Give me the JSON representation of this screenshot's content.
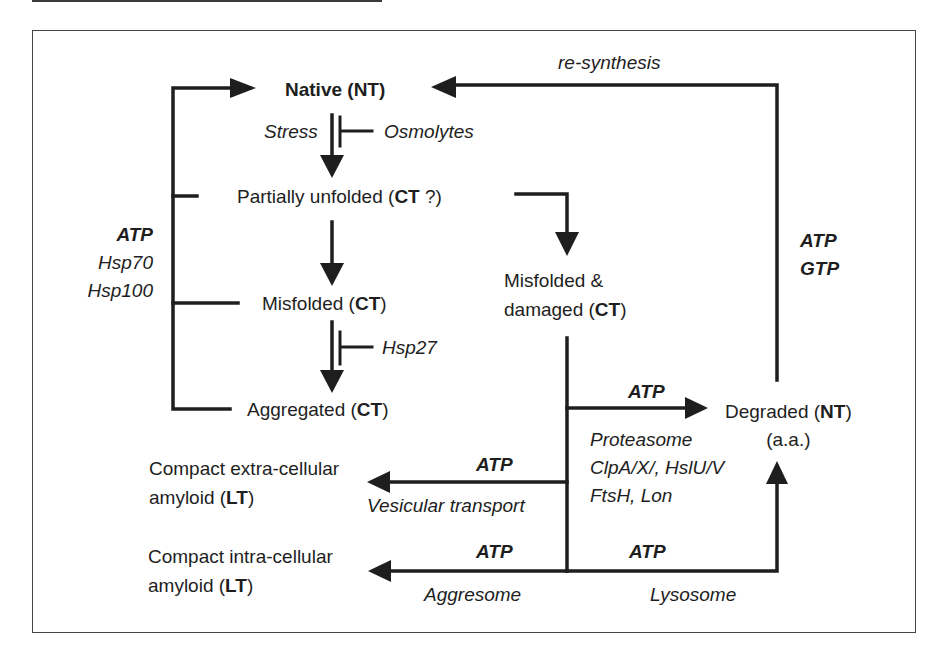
{
  "diagram": {
    "states": {
      "native": {
        "label": "Native",
        "tag": "NT"
      },
      "partially_unfolded": {
        "label": "Partially unfolded",
        "tag": "CT",
        "suffix": " ?"
      },
      "misfolded": {
        "label": "Misfolded",
        "tag": "CT"
      },
      "aggregated": {
        "label": "Aggregated",
        "tag": "CT"
      },
      "misfolded_damaged": {
        "line1": "Misfolded &",
        "line2_label": "damaged",
        "tag": "CT"
      },
      "degraded": {
        "label": "Degraded",
        "tag": "NT",
        "sub": "(a.a.)"
      },
      "extracellular_amyloid": {
        "line1": "Compact extra-cellular",
        "line2_label": "amyloid",
        "tag": "LT"
      },
      "intracellular_amyloid": {
        "line1": "Compact intra-cellular",
        "line2_label": "amyloid",
        "tag": "LT"
      }
    },
    "modifiers": {
      "stress": "Stress",
      "osmolytes": "Osmolytes",
      "hsp27": "Hsp27",
      "refolding": {
        "energy": "ATP",
        "chaperone1": "Hsp70",
        "chaperone2": "Hsp100"
      },
      "resynthesis": "re-synthesis",
      "resynthesis_energy": {
        "line1": "ATP",
        "line2": "GTP"
      },
      "proteasome_energy": "ATP",
      "proteasome": {
        "line1": "Proteasome",
        "line2": "ClpA/X/, HslU/V",
        "line3": "FtsH, Lon"
      },
      "vesicular_energy": "ATP",
      "vesicular": "Vesicular transport",
      "aggresome_energy": "ATP",
      "aggresome": "Aggresome",
      "lysosome_energy": "ATP",
      "lysosome": "Lysosome"
    },
    "paren_open": "(",
    "paren_close": ")"
  }
}
